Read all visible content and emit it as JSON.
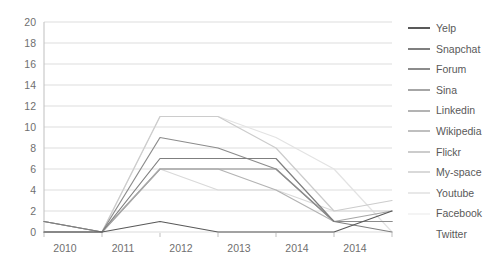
{
  "chart_data": {
    "type": "line",
    "title": "",
    "subtitle": "",
    "xlabel": "",
    "ylabel": "",
    "x": [
      "2010",
      "2011",
      "2012",
      "2013",
      "2014",
      "2014",
      "2016"
    ],
    "categories": [
      "2010",
      "2011",
      "2012",
      "2013",
      "2014",
      "2014",
      "2016"
    ],
    "xtick_labels": [
      "2010",
      "2011",
      "2012",
      "2013",
      "2014",
      "2014",
      "2016"
    ],
    "ytick_labels": [
      "0",
      "2",
      "4",
      "6",
      "8",
      "10",
      "12",
      "14",
      "16",
      "18",
      "20"
    ],
    "ytick_values": [
      0,
      2,
      4,
      6,
      8,
      10,
      12,
      14,
      16,
      18,
      20
    ],
    "ylim": [
      0,
      20
    ],
    "grid": "horizontal",
    "legend_position": "right",
    "background": "#ffffff",
    "series": [
      {
        "name": "Yelp",
        "color": "#595959",
        "values": [
          0,
          0,
          1,
          0,
          0,
          0,
          2
        ]
      },
      {
        "name": "Snapchat",
        "color": "#7f7f7f",
        "values": [
          1,
          0,
          7,
          7,
          7,
          1,
          0
        ]
      },
      {
        "name": "Forum",
        "color": "#8c8c8c",
        "values": [
          1,
          0,
          9,
          8,
          6,
          1,
          1
        ]
      },
      {
        "name": "Sina",
        "color": "#a6a6a6",
        "values": [
          0,
          0,
          6,
          6,
          6,
          1,
          2
        ]
      },
      {
        "name": "Linkedin",
        "color": "#b3b3b3",
        "values": [
          1,
          0,
          6,
          6,
          4,
          1,
          1
        ]
      },
      {
        "name": "Wikipedia",
        "color": "#bfbfbf",
        "values": [
          0,
          0,
          6,
          6,
          6,
          1,
          1
        ]
      },
      {
        "name": "Flickr",
        "color": "#cccccc",
        "values": [
          0,
          0,
          11,
          11,
          8,
          2,
          3
        ]
      },
      {
        "name": "My-space",
        "color": "#d9d9d9",
        "values": [
          0,
          0,
          6,
          4,
          4,
          2,
          2
        ]
      },
      {
        "name": "Youtube",
        "color": "#e3e3e3",
        "values": [
          0,
          0,
          11,
          11,
          9,
          6,
          0
        ]
      },
      {
        "name": "Facebook",
        "color": "#efefef",
        "values": [
          0,
          0,
          0,
          0,
          0,
          0,
          0
        ]
      },
      {
        "name": "Twitter",
        "color": "#ffffff",
        "values": [
          0,
          0,
          0,
          0,
          0,
          0,
          0
        ]
      }
    ]
  },
  "legend": {
    "items": [
      {
        "label": "Yelp",
        "color": "#595959"
      },
      {
        "label": "Snapchat",
        "color": "#7f7f7f"
      },
      {
        "label": "Forum",
        "color": "#8c8c8c"
      },
      {
        "label": "Sina",
        "color": "#a6a6a6"
      },
      {
        "label": "Linkedin",
        "color": "#b3b3b3"
      },
      {
        "label": "Wikipedia",
        "color": "#bfbfbf"
      },
      {
        "label": "Flickr",
        "color": "#cccccc"
      },
      {
        "label": "My-space",
        "color": "#d9d9d9"
      },
      {
        "label": "Youtube",
        "color": "#e8e8e8"
      },
      {
        "label": "Facebook",
        "color": "#f4f4f4"
      },
      {
        "label": "Twitter",
        "color": "#ffffff"
      }
    ]
  },
  "axes": {
    "grid_color": "#d9d9d9",
    "axis_color": "#bfbfbf",
    "tick_color": "#6f6f6f"
  }
}
